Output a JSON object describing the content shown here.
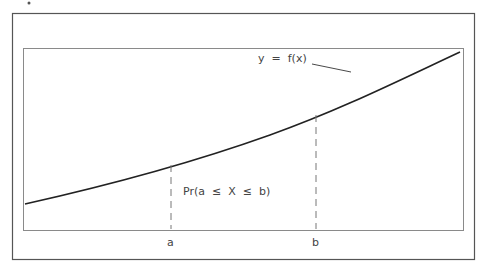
{
  "diagram": {
    "curve_label": "y  =  f(x)",
    "probability_label": "Pr(a  ≤  X  ≤  b)",
    "x_labels": {
      "a": "a",
      "b": "b"
    },
    "colors": {
      "frame": "#555555",
      "inner_box": "#8a8a8a",
      "curve": "#222222",
      "dash": "#777777",
      "text": "#444444"
    }
  }
}
